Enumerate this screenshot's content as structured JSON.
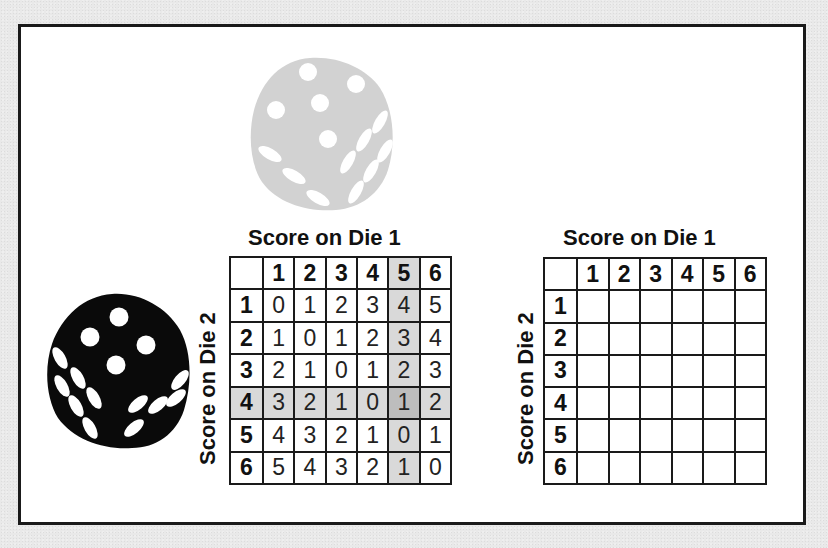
{
  "figure": {
    "gray_die": {
      "top_face_pips": 5,
      "left_face_pips": 3,
      "right_face_pips": 6,
      "color": "#d0d0d0"
    },
    "black_die": {
      "top_face_pips": 4,
      "left_face_pips": 6,
      "right_face_pips": 5,
      "color": "#0a0a0a"
    },
    "highlight_colors": {
      "row_col": "#d9d9d9",
      "intersection": "#bdbdbd"
    }
  },
  "left_table": {
    "title": "Score on Die 1",
    "side_label": "Score on Die 2",
    "col_headers": [
      "",
      "1",
      "2",
      "3",
      "4",
      "5",
      "6"
    ],
    "rows": [
      {
        "header": "1",
        "cells": [
          "0",
          "1",
          "2",
          "3",
          "4",
          "5"
        ]
      },
      {
        "header": "2",
        "cells": [
          "1",
          "0",
          "1",
          "2",
          "3",
          "4"
        ]
      },
      {
        "header": "3",
        "cells": [
          "2",
          "1",
          "0",
          "1",
          "2",
          "3"
        ]
      },
      {
        "header": "4",
        "cells": [
          "3",
          "2",
          "1",
          "0",
          "1",
          "2"
        ]
      },
      {
        "header": "5",
        "cells": [
          "4",
          "3",
          "2",
          "1",
          "0",
          "1"
        ]
      },
      {
        "header": "6",
        "cells": [
          "5",
          "4",
          "3",
          "2",
          "1",
          "0"
        ]
      }
    ],
    "highlighted_row": "4",
    "highlighted_col": "5"
  },
  "right_table": {
    "title": "Score on Die 1",
    "side_label": "Score on Die 2",
    "col_headers": [
      "",
      "1",
      "2",
      "3",
      "4",
      "5",
      "6"
    ],
    "rows": [
      {
        "header": "1",
        "cells": [
          "",
          "",
          "",
          "",
          "",
          ""
        ]
      },
      {
        "header": "2",
        "cells": [
          "",
          "",
          "",
          "",
          "",
          ""
        ]
      },
      {
        "header": "3",
        "cells": [
          "",
          "",
          "",
          "",
          "",
          ""
        ]
      },
      {
        "header": "4",
        "cells": [
          "",
          "",
          "",
          "",
          "",
          ""
        ]
      },
      {
        "header": "5",
        "cells": [
          "",
          "",
          "",
          "",
          "",
          ""
        ]
      },
      {
        "header": "6",
        "cells": [
          "",
          "",
          "",
          "",
          "",
          ""
        ]
      }
    ]
  }
}
